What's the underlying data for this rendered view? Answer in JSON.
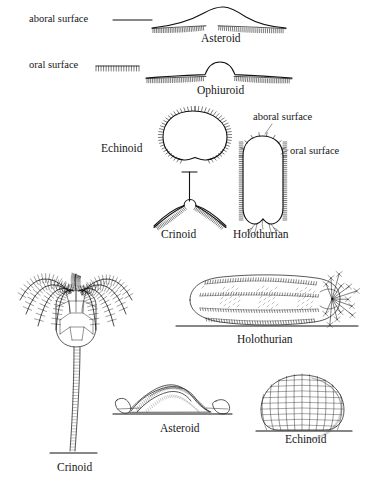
{
  "figure": {
    "ink_color": "#111111",
    "background_color": "#ffffff"
  },
  "key_labels": {
    "aboral_left": "aboral surface",
    "oral_left": "oral surface",
    "aboral_right": "aboral surface",
    "oral_right": "oral surface"
  },
  "schematics": [
    {
      "id": "asteroid-section",
      "caption": "Asteroid"
    },
    {
      "id": "ophiuroid-section",
      "caption": "Ophiuroid"
    },
    {
      "id": "echinoid-section",
      "caption": "Echinoid"
    },
    {
      "id": "crinoid-section",
      "caption": "Crinoid"
    },
    {
      "id": "holothurian-section",
      "caption": "Holothurian"
    }
  ],
  "habitus": [
    {
      "id": "crinoid-drawing",
      "caption": "Crinoid"
    },
    {
      "id": "holothurian-drawing",
      "caption": "Holothurian"
    },
    {
      "id": "asteroid-drawing",
      "caption": "Asteroid"
    },
    {
      "id": "echinoid-drawing",
      "caption": "Echinoid"
    }
  ]
}
